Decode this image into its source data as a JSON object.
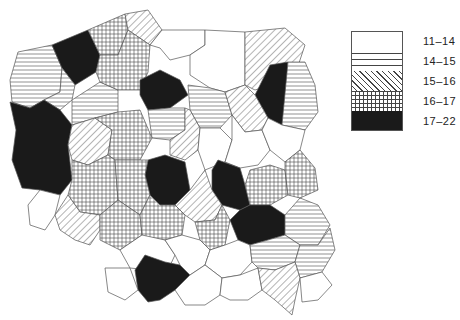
{
  "map": {
    "subject": "Poland voivodeships choropleth",
    "classes": [
      {
        "id": "c1",
        "range": "11-14",
        "pattern": "blank",
        "fill": "#ffffff"
      },
      {
        "id": "c2",
        "range": "14-15",
        "pattern": "horizontal-lines",
        "fill": "#ffffff"
      },
      {
        "id": "c3",
        "range": "15-16",
        "pattern": "diagonal-lines",
        "fill": "#ffffff"
      },
      {
        "id": "c4",
        "range": "16-17",
        "pattern": "cross-hatch",
        "fill": "#ffffff"
      },
      {
        "id": "c5",
        "range": "17-22",
        "pattern": "solid",
        "fill": "#1a1a1a"
      }
    ]
  },
  "legend": {
    "items": [
      {
        "label": "11–14"
      },
      {
        "label": "14–15"
      },
      {
        "label": "15–16"
      },
      {
        "label": "16–17"
      },
      {
        "label": "17–22"
      }
    ]
  },
  "regions": [
    {
      "cls": "c2",
      "pts": "18,52 52,45 62,68 60,92 44,100 30,108 12,102 10,80"
    },
    {
      "cls": "c5",
      "pts": "52,45 88,30 100,55 96,72 75,85 62,68"
    },
    {
      "cls": "c4",
      "pts": "88,30 125,14 128,30 118,55 100,55"
    },
    {
      "cls": "c3",
      "pts": "125,14 148,10 162,30 150,45 128,30"
    },
    {
      "cls": "c1",
      "pts": "162,30 205,30 205,45 190,55 170,60 160,48 150,45"
    },
    {
      "cls": "c1",
      "pts": "205,30 245,32 245,85 225,92 210,88 190,75 190,55 205,45"
    },
    {
      "cls": "c3",
      "pts": "245,32 285,28 305,45 296,72 270,85 255,90 245,85"
    },
    {
      "cls": "c5",
      "pts": "270,65 288,62 286,100 282,125 268,118 255,95"
    },
    {
      "cls": "c2",
      "pts": "288,62 305,62 315,85 318,112 305,130 282,125"
    },
    {
      "cls": "c2",
      "pts": "62,68 75,85 72,100 60,110 44,100 60,92"
    },
    {
      "cls": "c5",
      "pts": "10,102 30,108 44,100 60,110 72,125 68,145 72,180 60,195 40,190 22,188 12,160 16,130"
    },
    {
      "cls": "c2",
      "pts": "72,100 100,82 118,90 118,112 95,118 72,125"
    },
    {
      "cls": "c4",
      "pts": "100,55 118,55 128,30 150,45 148,72 140,90 118,90 100,82 96,72"
    },
    {
      "cls": "c5",
      "pts": "140,80 160,70 180,80 188,95 170,108 148,110 140,95"
    },
    {
      "cls": "c2",
      "pts": "188,85 210,88 225,92 232,115 220,128 200,128 190,110"
    },
    {
      "cls": "c3",
      "pts": "225,92 245,85 255,95 268,118 262,130 245,132 232,115"
    },
    {
      "cls": "c2",
      "pts": "148,110 170,108 185,108 185,130 170,140 152,138"
    },
    {
      "cls": "c3",
      "pts": "185,108 190,110 200,128 198,150 185,160 170,155 170,140 185,130"
    },
    {
      "cls": "c3",
      "pts": "72,125 95,118 112,130 108,155 88,165 72,160 68,145"
    },
    {
      "cls": "c4",
      "pts": "95,118 118,112 140,110 152,138 140,160 115,160 108,155 112,130"
    },
    {
      "cls": "c1",
      "pts": "200,128 220,128 232,140 225,162 205,170 198,150"
    },
    {
      "cls": "c1",
      "pts": "232,115 245,132 262,130 270,150 258,165 240,168 225,162 232,140"
    },
    {
      "cls": "c1",
      "pts": "268,118 282,125 305,130 300,150 285,162 270,150 262,130"
    },
    {
      "cls": "c1",
      "pts": "40,190 60,195 55,215 45,230 30,225 28,205"
    },
    {
      "cls": "c4",
      "pts": "72,160 88,165 108,155 115,160 118,200 100,215 80,212 68,195 72,180"
    },
    {
      "cls": "c5",
      "pts": "148,160 165,155 185,162 190,190 175,205 160,205 150,195 145,175"
    },
    {
      "cls": "c4",
      "pts": "115,160 140,160 148,160 145,175 150,195 140,215 118,200"
    },
    {
      "cls": "c5",
      "pts": "218,160 240,168 245,185 250,205 240,210 222,205 212,190 212,170"
    },
    {
      "cls": "c4",
      "pts": "250,170 270,165 285,170 288,195 270,205 250,205 245,185"
    },
    {
      "cls": "c4",
      "pts": "285,162 300,150 315,168 318,190 300,198 288,195 285,170"
    },
    {
      "cls": "c3",
      "pts": "55,215 68,195 80,212 100,215 100,230 90,245 75,240 60,230"
    },
    {
      "cls": "c4",
      "pts": "100,215 118,200 140,215 142,235 120,250 100,240 100,230"
    },
    {
      "cls": "c3",
      "pts": "175,205 190,190 205,170 212,190 222,205 215,220 195,222 185,215"
    },
    {
      "cls": "c4",
      "pts": "140,215 150,195 160,205 175,205 185,215 182,235 165,240 145,238 142,235"
    },
    {
      "cls": "c4",
      "pts": "195,222 215,220 222,205 230,220 225,245 210,250 200,240"
    },
    {
      "cls": "c5",
      "pts": "230,220 240,210 250,205 270,205 285,215 285,235 268,240 250,245 238,240"
    },
    {
      "cls": "c2",
      "pts": "285,215 300,198 318,205 330,225 318,245 300,245 285,235"
    },
    {
      "cls": "c1",
      "pts": "120,250 142,235 165,240 175,255 168,270 150,270 130,268"
    },
    {
      "cls": "c5",
      "pts": "135,270 145,255 165,262 180,265 190,275 175,290 160,300 148,302 138,290"
    },
    {
      "cls": "c1",
      "pts": "165,240 182,235 200,240 210,250 205,265 190,275 180,265 175,255"
    },
    {
      "cls": "c1",
      "pts": "210,250 225,245 238,240 250,245 252,262 240,275 222,278 205,265"
    },
    {
      "cls": "c2",
      "pts": "250,245 268,240 285,235 300,245 295,262 275,270 258,268 252,262"
    },
    {
      "cls": "c2",
      "pts": "300,245 318,245 330,228 335,250 322,272 300,278 295,262"
    },
    {
      "cls": "c1",
      "pts": "105,268 130,268 138,290 125,300 108,292"
    },
    {
      "cls": "c1",
      "pts": "175,290 190,275 205,265 222,278 220,295 205,305 185,305"
    },
    {
      "cls": "c1",
      "pts": "222,278 240,275 258,268 262,290 248,300 230,300 220,295"
    },
    {
      "cls": "c3",
      "pts": "262,290 258,268 275,270 295,262 300,278 295,300 292,315 275,300"
    },
    {
      "cls": "c1",
      "pts": "300,278 322,272 332,285 318,300 302,302"
    }
  ]
}
